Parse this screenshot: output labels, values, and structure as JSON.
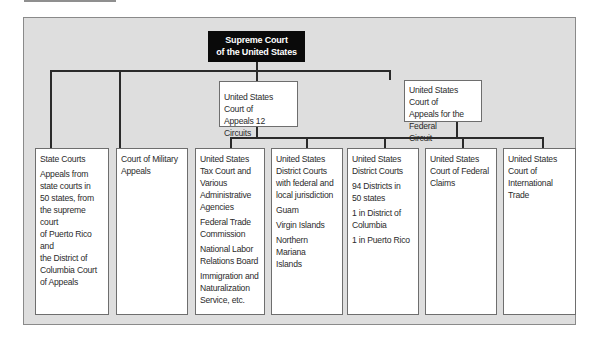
{
  "diagram": {
    "root": {
      "line1": "Supreme Court",
      "line2": "of the United States"
    },
    "intermediate": [
      {
        "id": "circuits",
        "lines": [
          "United States Court of",
          "Appeals 12 Circuits"
        ]
      },
      {
        "id": "federal-circuit",
        "lines": [
          "United States Court of",
          "Appeals for the Federal",
          "Circuit"
        ]
      }
    ],
    "courts": [
      {
        "id": "state-courts",
        "title": [
          "State Courts"
        ],
        "sections": [
          [
            "Appeals from",
            "state courts in",
            "50 states, from",
            "the supreme court",
            "of Puerto Rico and",
            "the District of",
            "Columbia Court",
            "of Appeals"
          ]
        ]
      },
      {
        "id": "military-appeals",
        "title": [
          "Court of Military",
          "Appeals"
        ],
        "sections": []
      },
      {
        "id": "tax-court",
        "title": [
          "United States",
          "Tax Court and",
          "Various",
          "Administrative",
          "Agencies"
        ],
        "sections": [
          [
            "Federal Trade",
            "Commission"
          ],
          [
            "National Labor",
            "Relations Board"
          ],
          [
            "Immigration and",
            "Naturalization",
            "Service, etc."
          ]
        ]
      },
      {
        "id": "district-courts-territories",
        "title": [
          "United States",
          "District Courts",
          "with federal and",
          "local jurisdiction"
        ],
        "sections": [
          [
            "Guam"
          ],
          [
            "Virgin Islands"
          ],
          [
            "Northern Mariana",
            "Islands"
          ]
        ]
      },
      {
        "id": "district-courts",
        "title": [
          "United States",
          "District Courts"
        ],
        "sections": [
          [
            "94 Districts in",
            "50 states"
          ],
          [
            "1 in District of",
            "Columbia"
          ],
          [
            "1 in Puerto Rico"
          ]
        ]
      },
      {
        "id": "federal-claims",
        "title": [
          "United States",
          "Court of Federal",
          "Claims"
        ],
        "sections": []
      },
      {
        "id": "international-trade",
        "title": [
          "United States",
          "Court of",
          "International Trade"
        ],
        "sections": []
      }
    ]
  }
}
